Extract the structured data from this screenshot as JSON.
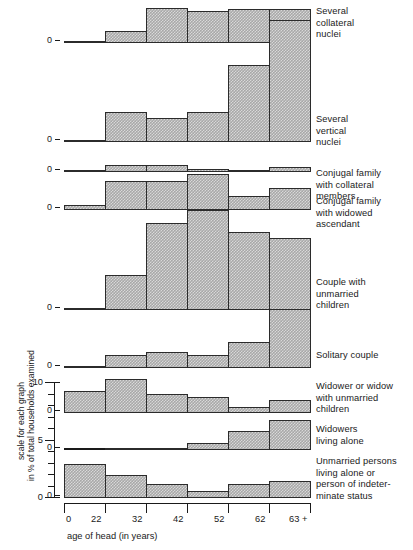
{
  "figure": {
    "x_axis_title": "age of head (in years)",
    "scale_caption_line1": "scale for each graph",
    "scale_caption_line2": "in % of total households examined",
    "scale_ticks": [
      "0",
      "5",
      "10"
    ],
    "zero_label": "0",
    "bar_fill_color": "#a8a8a8",
    "bar_edge_color": "#2b2b2b"
  },
  "chart_data": {
    "type": "bar",
    "title": "",
    "xlabel": "age of head (in years)",
    "ylabel": "scale for each graph in % of total households examined",
    "categories": [
      "0",
      "22",
      "32",
      "42",
      "52",
      "62"
    ],
    "tick_labels": [
      "0",
      "22",
      "32",
      "42",
      "52",
      "62",
      "63 +"
    ],
    "ylim": [
      0,
      11
    ],
    "y_ticks": [
      0,
      5,
      10
    ],
    "grid": false,
    "legend": "none",
    "panel_layout": "stacked small multiples, one histogram per household type",
    "series": [
      {
        "name": "Several collateral nuclei",
        "values": [
          0.2,
          1.0,
          3.0,
          2.8,
          2.9,
          2.9
        ]
      },
      {
        "name": "Several vertical nuclei",
        "values": [
          0.2,
          2.6,
          2.1,
          2.6,
          6.6,
          10.5
        ]
      },
      {
        "name": "Conjugal family with collateral members",
        "values": [
          0.1,
          0.6,
          0.6,
          0.3,
          0.1,
          0.4
        ]
      },
      {
        "name": "Conjugal family with widowed ascendant",
        "values": [
          0.4,
          2.5,
          2.5,
          3.1,
          1.2,
          1.9
        ]
      },
      {
        "name": "Couple with unmarried children",
        "values": [
          0.2,
          3.0,
          7.5,
          8.6,
          6.7,
          6.2
        ]
      },
      {
        "name": "Solitary couple",
        "values": [
          0.2,
          1.1,
          1.4,
          1.1,
          2.2,
          5.1
        ]
      },
      {
        "name": "Widower or widow with unmarried children",
        "values": [
          1.9,
          2.9,
          1.6,
          1.4,
          0.5,
          1.1
        ]
      },
      {
        "name": "Widowers living alone",
        "values": [
          0.0,
          0.15,
          0.15,
          0.6,
          1.6,
          2.6
        ]
      },
      {
        "name": "Unmarried persons living alone or person of indeterminate status",
        "values": [
          2.9,
          2.0,
          1.2,
          0.6,
          1.2,
          1.5
        ]
      }
    ]
  },
  "panels": [
    {
      "id": "several-collateral-nuclei",
      "caption": [
        "Several",
        "collateral",
        "nuclei"
      ]
    },
    {
      "id": "several-vertical-nuclei",
      "caption": [
        "Several",
        "vertical",
        "nuclei"
      ]
    },
    {
      "id": "conjugal-family-collateral-members",
      "caption": [
        "Conjugal family",
        "with collateral",
        "members"
      ]
    },
    {
      "id": "conjugal-family-widowed-ascendant",
      "caption": [
        "Conjugal family",
        "with widowed",
        "ascendant"
      ]
    },
    {
      "id": "couple-with-unmarried-children",
      "caption": [
        "Couple with",
        "unmarried",
        "children"
      ]
    },
    {
      "id": "solitary-couple",
      "caption": [
        "Solitary couple"
      ]
    },
    {
      "id": "widower-or-widow-unmarried-children",
      "caption": [
        "Widower or widow",
        "with unmarried",
        "children"
      ]
    },
    {
      "id": "widowers-living-alone",
      "caption": [
        "Widowers",
        "living alone"
      ]
    },
    {
      "id": "unmarried-persons-living-alone",
      "caption": [
        "Unmarried persons",
        "living alone or",
        "person of indeter-",
        "minate status"
      ]
    }
  ]
}
